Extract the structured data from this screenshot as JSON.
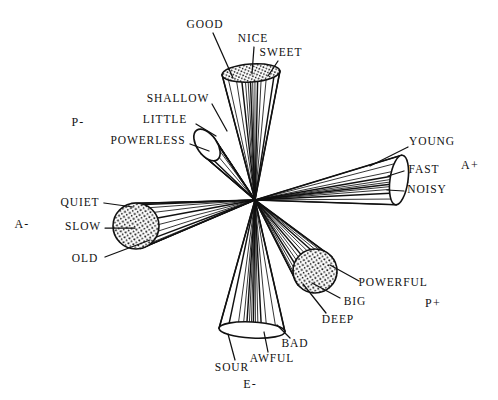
{
  "figure": {
    "background_color": "#ffffff",
    "ink_color": "#111111",
    "center": {
      "x": 255,
      "y": 200
    }
  },
  "axis_labels": [
    {
      "name": "axis-label-p-minus",
      "text": "P-",
      "x": 78,
      "y": 122
    },
    {
      "name": "axis-label-a-minus",
      "text": "A-",
      "x": 22,
      "y": 224
    },
    {
      "name": "axis-label-a-plus",
      "text": "A+",
      "x": 470,
      "y": 165
    },
    {
      "name": "axis-label-p-plus",
      "text": "P+",
      "x": 433,
      "y": 303
    },
    {
      "name": "axis-label-e-minus",
      "text": "E-",
      "x": 250,
      "y": 384
    }
  ],
  "scale_labels": [
    {
      "name": "scale-label-good",
      "text": "GOOD",
      "x": 205,
      "y": 25,
      "cone": "E+"
    },
    {
      "name": "scale-label-nice",
      "text": "NICE",
      "x": 253,
      "y": 39,
      "cone": "E+"
    },
    {
      "name": "scale-label-sweet",
      "text": "SWEET",
      "x": 281,
      "y": 53,
      "cone": "E+"
    },
    {
      "name": "scale-label-shallow",
      "text": "SHALLOW",
      "x": 178,
      "y": 99,
      "cone": "P-"
    },
    {
      "name": "scale-label-little",
      "text": "LITTLE",
      "x": 165,
      "y": 120,
      "cone": "P-"
    },
    {
      "name": "scale-label-powerless",
      "text": "POWERLESS",
      "x": 148,
      "y": 141,
      "cone": "P-"
    },
    {
      "name": "scale-label-young",
      "text": "YOUNG",
      "x": 432,
      "y": 142,
      "cone": "A+"
    },
    {
      "name": "scale-label-fast",
      "text": "FAST",
      "x": 424,
      "y": 170,
      "cone": "A+"
    },
    {
      "name": "scale-label-noisy",
      "text": "NOISY",
      "x": 427,
      "y": 190,
      "cone": "A+"
    },
    {
      "name": "scale-label-quiet",
      "text": "QUIET",
      "x": 80,
      "y": 203,
      "cone": "A-"
    },
    {
      "name": "scale-label-slow",
      "text": "SLOW",
      "x": 83,
      "y": 227,
      "cone": "A-"
    },
    {
      "name": "scale-label-old",
      "text": "OLD",
      "x": 85,
      "y": 259,
      "cone": "A-"
    },
    {
      "name": "scale-label-powerful",
      "text": "POWERFUL",
      "x": 393,
      "y": 283,
      "cone": "P+"
    },
    {
      "name": "scale-label-big",
      "text": "BIG",
      "x": 355,
      "y": 302,
      "cone": "P+"
    },
    {
      "name": "scale-label-deep",
      "text": "DEEP",
      "x": 338,
      "y": 320,
      "cone": "P+"
    },
    {
      "name": "scale-label-bad",
      "text": "BAD",
      "x": 295,
      "y": 344,
      "cone": "E-"
    },
    {
      "name": "scale-label-awful",
      "text": "AWFUL",
      "x": 272,
      "y": 359,
      "cone": "E-"
    },
    {
      "name": "scale-label-sour",
      "text": "SOUR",
      "x": 232,
      "y": 368,
      "cone": "E-"
    }
  ],
  "cones": [
    {
      "name": "cone-e-plus",
      "axis": "E+",
      "apex": {
        "x": 255,
        "y": 200
      },
      "cap": {
        "kind": "ellipse",
        "cx": 251,
        "cy": 73,
        "rx": 29,
        "ry": 9,
        "rotation": -4,
        "fill": "stippled"
      },
      "ray_count": 13,
      "direction_deg": -88
    },
    {
      "name": "cone-e-minus",
      "axis": "E-",
      "apex": {
        "x": 255,
        "y": 200
      },
      "cap": {
        "kind": "ellipse",
        "cx": 252,
        "cy": 330,
        "rx": 33,
        "ry": 8,
        "rotation": 3,
        "fill": "open"
      },
      "ray_count": 13,
      "direction_deg": 91
    },
    {
      "name": "cone-a-plus",
      "axis": "A+",
      "apex": {
        "x": 255,
        "y": 200
      },
      "cap": {
        "kind": "ellipse",
        "cx": 399,
        "cy": 180,
        "rx": 9,
        "ry": 25,
        "rotation": 8,
        "fill": "open"
      },
      "ray_count": 11,
      "direction_deg": -8
    },
    {
      "name": "cone-a-minus",
      "axis": "A-",
      "apex": {
        "x": 255,
        "y": 200
      },
      "cap": {
        "kind": "circle",
        "cx": 136,
        "cy": 226,
        "r": 23,
        "fill": "stippled"
      },
      "ray_count": 11,
      "direction_deg": 168
    },
    {
      "name": "cone-p-plus",
      "axis": "P+",
      "apex": {
        "x": 255,
        "y": 200
      },
      "cap": {
        "kind": "circle",
        "cx": 315,
        "cy": 271,
        "r": 22,
        "fill": "stippled"
      },
      "ray_count": 12,
      "direction_deg": 48
    },
    {
      "name": "cone-p-minus",
      "axis": "P-",
      "apex": {
        "x": 255,
        "y": 200
      },
      "cap": {
        "kind": "ellipse",
        "cx": 207,
        "cy": 145,
        "rx": 10,
        "ry": 18,
        "rotation": -35,
        "fill": "open"
      },
      "ray_count": 9,
      "direction_deg": -133
    }
  ],
  "leader_lines": [
    {
      "name": "leader-good",
      "x1": 213,
      "y1": 33,
      "x2": 233,
      "y2": 78
    },
    {
      "name": "leader-nice",
      "x1": 254,
      "y1": 47,
      "x2": 252,
      "y2": 74
    },
    {
      "name": "leader-sweet",
      "x1": 278,
      "y1": 61,
      "x2": 268,
      "y2": 76
    },
    {
      "name": "leader-shallow",
      "x1": 212,
      "y1": 104,
      "x2": 227,
      "y2": 131
    },
    {
      "name": "leader-little",
      "x1": 196,
      "y1": 124,
      "x2": 216,
      "y2": 136
    },
    {
      "name": "leader-powerless",
      "x1": 190,
      "y1": 144,
      "x2": 209,
      "y2": 151
    },
    {
      "name": "leader-young",
      "x1": 408,
      "y1": 147,
      "x2": 370,
      "y2": 166
    },
    {
      "name": "leader-fast",
      "x1": 404,
      "y1": 171,
      "x2": 388,
      "y2": 176
    },
    {
      "name": "leader-noisy",
      "x1": 404,
      "y1": 191,
      "x2": 387,
      "y2": 190
    },
    {
      "name": "leader-quiet",
      "x1": 104,
      "y1": 203,
      "x2": 133,
      "y2": 207
    },
    {
      "name": "leader-slow",
      "x1": 105,
      "y1": 228,
      "x2": 135,
      "y2": 228
    },
    {
      "name": "leader-old",
      "x1": 105,
      "y1": 257,
      "x2": 150,
      "y2": 240
    },
    {
      "name": "leader-powerful",
      "x1": 359,
      "y1": 281,
      "x2": 330,
      "y2": 265
    },
    {
      "name": "leader-big",
      "x1": 340,
      "y1": 298,
      "x2": 312,
      "y2": 283
    },
    {
      "name": "leader-deep",
      "x1": 326,
      "y1": 313,
      "x2": 303,
      "y2": 284
    },
    {
      "name": "leader-bad",
      "x1": 290,
      "y1": 338,
      "x2": 277,
      "y2": 325
    },
    {
      "name": "leader-awful",
      "x1": 268,
      "y1": 352,
      "x2": 264,
      "y2": 332
    },
    {
      "name": "leader-sour",
      "x1": 235,
      "y1": 360,
      "x2": 228,
      "y2": 334
    }
  ]
}
